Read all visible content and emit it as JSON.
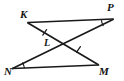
{
  "figure": {
    "type": "geometry-diagram",
    "background_color": "#ffffff",
    "stroke_color": "#1a1a1a",
    "vertices": [
      {
        "id": "K",
        "label": "K",
        "x": 28,
        "y": 22
      },
      {
        "id": "P",
        "label": "P",
        "x": 113,
        "y": 19
      },
      {
        "id": "N",
        "label": "N",
        "x": 12,
        "y": 69
      },
      {
        "id": "M",
        "label": "M",
        "x": 98,
        "y": 65
      },
      {
        "id": "L",
        "label": "L",
        "x": 58,
        "y": 43
      }
    ],
    "segments": [
      {
        "name": "segment-KP",
        "from": "K",
        "to": "P"
      },
      {
        "name": "segment-KM",
        "from": "K",
        "to": "M"
      },
      {
        "name": "segment-NP",
        "from": "N",
        "to": "P"
      },
      {
        "name": "segment-NM",
        "from": "N",
        "to": "M"
      }
    ],
    "congruence_ticks": [
      {
        "name": "tick-on-KL",
        "on_segment": "segment-KM",
        "count": 1,
        "x": 44,
        "y": 33
      },
      {
        "name": "tick-on-LM",
        "on_segment": "segment-NP",
        "count": 1,
        "x": 78,
        "y": 50
      }
    ],
    "angle_arcs": [
      {
        "name": "angle-arc-at-P",
        "at_vertex": "P"
      },
      {
        "name": "angle-arc-at-N",
        "at_vertex": "N"
      }
    ],
    "labels": {
      "K": "K",
      "P": "P",
      "N": "N",
      "M": "M",
      "L": "L"
    }
  }
}
